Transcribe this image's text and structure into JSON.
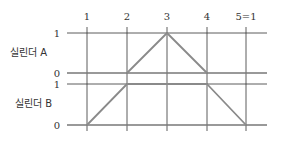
{
  "diagram": {
    "type": "displacement-step diagram",
    "step_labels": [
      "1",
      "2",
      "3",
      "4",
      "5=1"
    ],
    "cylinders": [
      {
        "name": "실린더 A",
        "level_labels": {
          "top": "1",
          "bottom": "0"
        },
        "values": [
          0,
          0,
          1,
          0,
          0
        ]
      },
      {
        "name": "실린더 B",
        "level_labels": {
          "top": "1",
          "bottom": "0"
        },
        "values": [
          0,
          1,
          1,
          1,
          0
        ]
      }
    ]
  },
  "colors": {
    "grid": "#333333",
    "motion_line": "#8a8a8a"
  }
}
